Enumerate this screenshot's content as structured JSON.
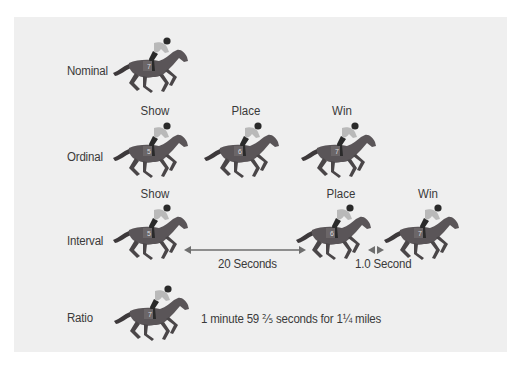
{
  "rows": [
    {
      "id": "nominal",
      "label": "Nominal"
    },
    {
      "id": "ordinal",
      "label": "Ordinal"
    },
    {
      "id": "interval",
      "label": "Interval"
    },
    {
      "id": "ratio",
      "label": "Ratio"
    }
  ],
  "positions": {
    "show": "Show",
    "place": "Place",
    "win": "Win"
  },
  "horses": {
    "nominal": {
      "number": "7"
    },
    "ordinal": [
      {
        "position": "Show",
        "number": "5"
      },
      {
        "position": "Place",
        "number": "6"
      },
      {
        "position": "Win",
        "number": "7"
      }
    ],
    "interval": [
      {
        "position": "Show",
        "number": "5"
      },
      {
        "position": "Place",
        "number": "6"
      },
      {
        "position": "Win",
        "number": "7"
      }
    ],
    "ratio": {
      "number": "7"
    }
  },
  "annotations": {
    "interval_gap_1": "20 Seconds",
    "interval_gap_2": "1.0 Second",
    "ratio_time": "1 minute 59 ⅖ seconds for 1¼ miles"
  },
  "colors": {
    "panel": "#efefef",
    "horse": "#5a5558",
    "jockey_shirt": "#b9b9b9",
    "text": "#3a3a3a",
    "arrow": "#6e6e6e"
  }
}
